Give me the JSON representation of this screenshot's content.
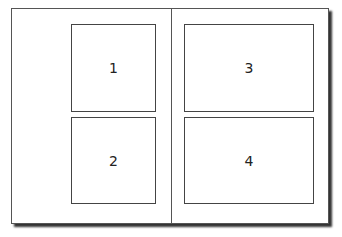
{
  "diagram": {
    "panels": [
      {
        "label": "1"
      },
      {
        "label": "2"
      },
      {
        "label": "3"
      },
      {
        "label": "4"
      }
    ]
  }
}
